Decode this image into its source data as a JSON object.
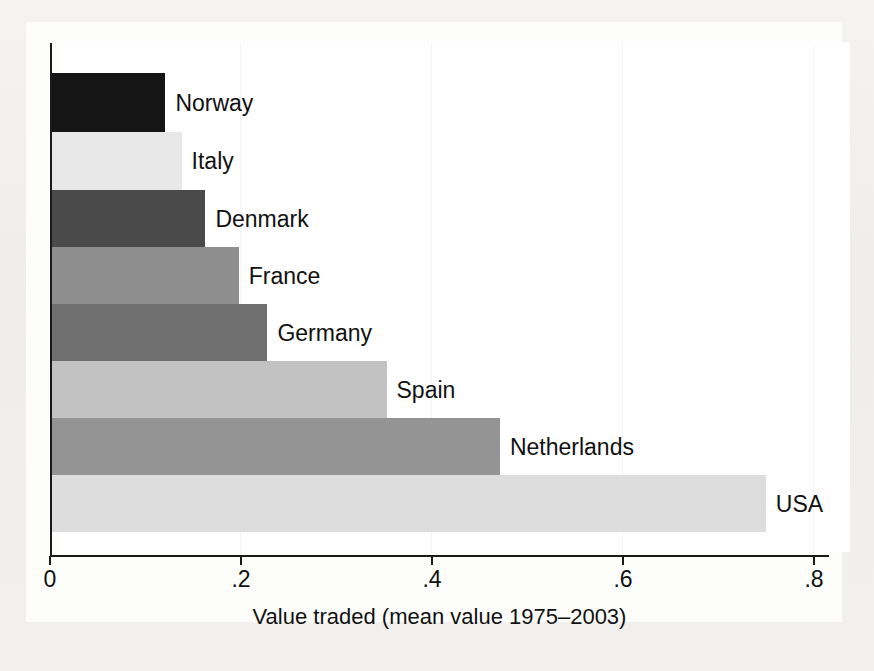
{
  "chart_data": {
    "type": "bar",
    "orientation": "horizontal",
    "title": "",
    "xlabel": "Value traded (mean value 1975–2003)",
    "ylabel": "",
    "xlim": [
      0,
      0.8
    ],
    "grid": false,
    "legend": "none",
    "xticks": [
      "0",
      ".2",
      ".4",
      ".6",
      ".8"
    ],
    "xtick_values": [
      0,
      0.2,
      0.4,
      0.6,
      0.8
    ],
    "categories": [
      "Norway",
      "Italy",
      "Denmark",
      "France",
      "Germany",
      "Spain",
      "Netherlands",
      "USA"
    ],
    "values": [
      0.119,
      0.136,
      0.161,
      0.196,
      0.226,
      0.351,
      0.47,
      0.749
    ],
    "bars": [
      {
        "label": "Norway",
        "value": 0.119,
        "color": "#151515"
      },
      {
        "label": "Italy",
        "value": 0.136,
        "color": "#e8e8e8"
      },
      {
        "label": "Denmark",
        "value": 0.161,
        "color": "#4a4a4a"
      },
      {
        "label": "France",
        "value": 0.196,
        "color": "#8e8e8e"
      },
      {
        "label": "Germany",
        "value": 0.226,
        "color": "#6f6f6f"
      },
      {
        "label": "Spain",
        "value": 0.351,
        "color": "#c2c2c2"
      },
      {
        "label": "Netherlands",
        "value": 0.47,
        "color": "#949494"
      },
      {
        "label": "USA",
        "value": 0.749,
        "color": "#dddddd"
      }
    ]
  },
  "axis": {
    "x_title": "Value traded (mean value 1975–2003)",
    "tick_0": "0",
    "tick_1": ".2",
    "tick_2": ".4",
    "tick_3": ".6",
    "tick_4": ".8"
  },
  "labels": {
    "norway": "Norway",
    "italy": "Italy",
    "denmark": "Denmark",
    "france": "France",
    "germany": "Germany",
    "spain": "Spain",
    "netherlands": "Netherlands",
    "usa": "USA"
  },
  "colors": {
    "axis": "#1a1a1a",
    "text": "#111111",
    "plot_background": "#ffffff",
    "page_background": "#f2f1ef"
  }
}
